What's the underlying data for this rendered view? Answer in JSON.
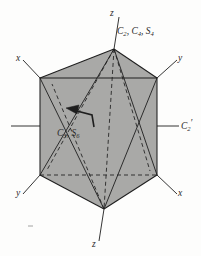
{
  "figure": {
    "shape": "hexagonal-prism",
    "colors": {
      "face_fill": "#a9a9a7",
      "stroke": "#1e1e1e",
      "background": "#fdfdfc",
      "label_color": "#2a2a2a"
    },
    "axes": {
      "x_upper_left": "x",
      "y_upper_right": "y",
      "y_lower_left": "y",
      "x_lower_right": "x",
      "z_top": "z",
      "z_bottom": "z"
    },
    "symmetry_labels": {
      "top": "C2, C4, S4",
      "top_parts": {
        "first_letter": "C",
        "first_sub": "2",
        "second_letter": "C",
        "second_sub": "4",
        "third_letter": "S",
        "third_sub": "4",
        "sep1": ", ",
        "sep2": ", "
      },
      "center": "C3, S6",
      "center_parts": {
        "first_letter": "C",
        "first_sub": "3",
        "sep": ", ",
        "second_letter": "S",
        "second_sub": "6"
      },
      "right": "C2'",
      "right_parts": {
        "letter": "C",
        "sub": "2",
        "prime": "′"
      }
    },
    "geometry": {
      "top_vertex": [
        114,
        49
      ],
      "bottom_vertex": [
        104,
        209
      ],
      "front_face_corners": [
        [
          40,
          78
        ],
        [
          157,
          78
        ],
        [
          157,
          175
        ],
        [
          40,
          175
        ]
      ],
      "hex_note": "hexagonal outline with shaded front rectangle, dashed hidden edges"
    }
  }
}
